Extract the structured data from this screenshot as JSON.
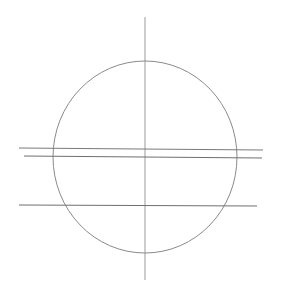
{
  "diagram": {
    "type": "geometric-construction",
    "background": "#ffffff",
    "circle": {
      "cx": 145,
      "cy": 157,
      "rx": 92,
      "ry": 96,
      "stroke": "#8a8a8a",
      "stroke_width": 1
    },
    "vertical_axis": {
      "x": 145,
      "y1": 17,
      "y2": 280,
      "stroke": "#8f8f8f",
      "stroke_width": 0.9
    },
    "horizontal_lines": [
      {
        "id": "line-1",
        "x1": 19,
        "y1": 148,
        "x2": 263,
        "y2": 150,
        "stroke": "#7a7a7a"
      },
      {
        "id": "line-2",
        "x1": 24,
        "y1": 156,
        "x2": 262,
        "y2": 158,
        "stroke": "#6f6f6f"
      },
      {
        "id": "line-3",
        "x1": 19,
        "y1": 205,
        "x2": 257,
        "y2": 206,
        "stroke": "#6f6f6f"
      }
    ]
  }
}
